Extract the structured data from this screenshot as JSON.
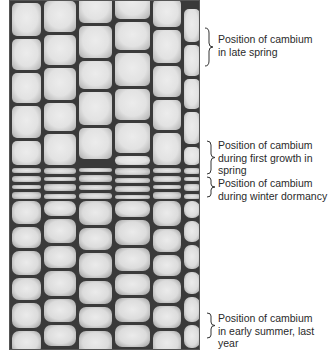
{
  "figure": {
    "colors": {
      "cell_fill": "#e6e6e6",
      "cell_wall": "#3a3a3a",
      "text": "#2a2a2a"
    }
  },
  "labels": [
    {
      "id": "late-spring",
      "text": "Position of cambium\nin late spring",
      "brace_top": 27,
      "brace_bottom": 67,
      "text_top": 33
    },
    {
      "id": "first-growth-spring",
      "text": "Position of cambium\nduring first growth in\nspring",
      "brace_top": 140,
      "brace_bottom": 175,
      "text_top": 139
    },
    {
      "id": "winter-dormancy",
      "text": "Position of cambium\nduring winter dormancy",
      "brace_top": 176,
      "brace_bottom": 197,
      "text_top": 177
    },
    {
      "id": "early-summer-last-year",
      "text": "Position of cambium\nin early summer, last\nyear",
      "brace_top": 312,
      "brace_bottom": 338,
      "text_top": 312
    }
  ]
}
